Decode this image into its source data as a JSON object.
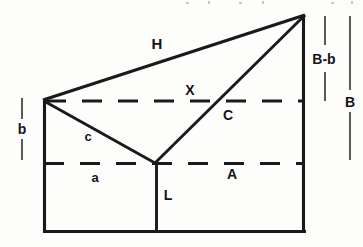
{
  "figure": {
    "background_color": "#fdfdfc",
    "line_color": "#1a1a1a",
    "label_color": "#141414"
  },
  "labels": {
    "hypotenuse_H": "H",
    "upper_dashed_X": "X",
    "diagonal_C": "C",
    "lower_diagonal_c": "c",
    "lower_dashed_a": "a",
    "lower_dashed_A": "A",
    "vertical_L": "L",
    "left_height_b": "b",
    "right_height_B_minus_b": "B-b",
    "right_height_B": "B"
  },
  "geometry": {
    "outline": {
      "left_x": 43,
      "right_x": 305,
      "bottom_y": 233,
      "top_left_y": 100,
      "apex_y": 15
    },
    "center_vertical_x": 155,
    "junction_y": 163,
    "upper_dashed_y": 100,
    "lower_dashed_y": 163
  },
  "dimensions": {
    "b": {
      "label": "b",
      "from_y": 98,
      "to_y": 160,
      "x": 22
    },
    "B_minus_b": {
      "label": "B-b",
      "from_y": 15,
      "to_y": 100,
      "x": 322
    },
    "B": {
      "label": "B",
      "from_y": 15,
      "to_y": 160,
      "x": 350
    }
  }
}
